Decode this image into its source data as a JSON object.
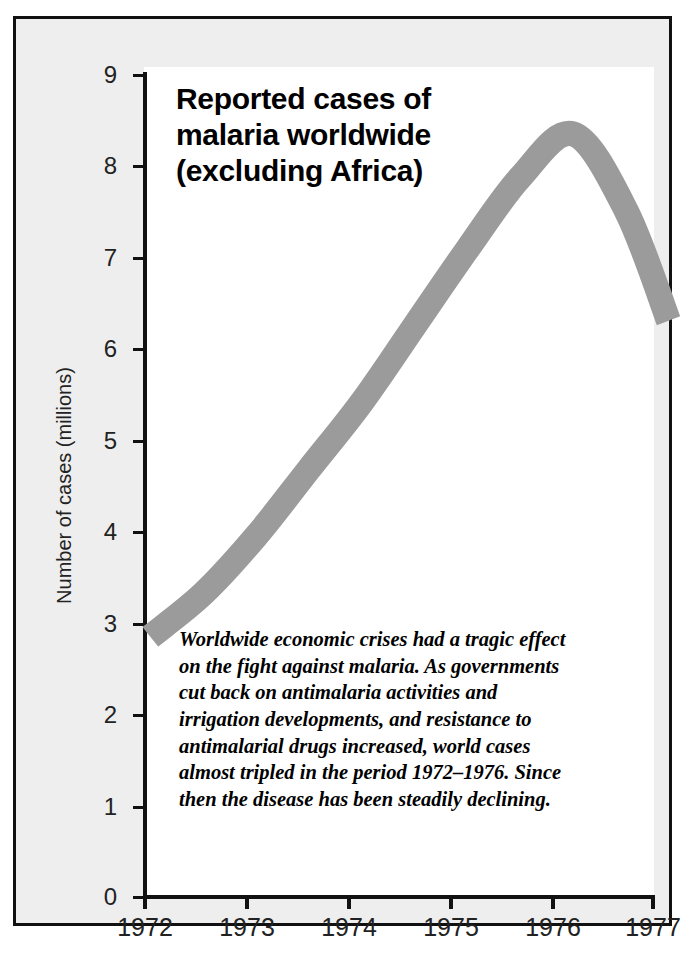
{
  "figure": {
    "background_color": "#ffffff",
    "panel_fill": "#eeeeee",
    "plot_fill": "#ffffff",
    "frame_color": "#111111"
  },
  "chart_data": {
    "type": "line",
    "title": "Reported cases of malaria worldwide (excluding Africa)",
    "title_lines": [
      "Reported cases of",
      "malaria worldwide",
      "(excluding Africa)"
    ],
    "xlabel": "",
    "ylabel": "Number of cases (millions)",
    "xlim": [
      1972,
      1977
    ],
    "ylim": [
      0,
      9
    ],
    "xticks": [
      1972,
      1973,
      1974,
      1975,
      1976,
      1977
    ],
    "xtick_labels": [
      "1972",
      "1973",
      "1974",
      "1975",
      "1976",
      "1977"
    ],
    "yticks": [
      0,
      1,
      2,
      3,
      4,
      5,
      6,
      7,
      8,
      9
    ],
    "ytick_labels": [
      "0",
      "1",
      "2",
      "3",
      "4",
      "5",
      "6",
      "7",
      "8",
      "9"
    ],
    "grid": false,
    "legend": false,
    "series_style": {
      "name": "Reported malaria cases (excluding Africa)",
      "render": "thick-band",
      "color": "#9b9b9b",
      "band_width_units": 0.26,
      "line_width_px": 24
    },
    "x": [
      1972,
      1972.5,
      1973,
      1973.5,
      1974,
      1974.5,
      1975,
      1975.5,
      1976,
      1976.5,
      1976.9
    ],
    "values": [
      3.15,
      3.6,
      4.2,
      4.9,
      5.6,
      6.4,
      7.2,
      7.95,
      8.4,
      7.6,
      6.45
    ],
    "annotations": [
      {
        "name": "caption",
        "text": "Worldwide economic crises had a tragic effect on the fight against malaria. As governments cut back on antimalaria activities and irrigation developments, and resistance to antimalarial drugs increased, world cases almost tripled in the period 1972–1976. Since then the disease has been steadily declining.",
        "lines": [
          "Worldwide economic crises had a tragic effect",
          "on the fight against malaria. As governments",
          "cut back on antimalaria activities and",
          "irrigation developments, and resistance to",
          "antimalarial drugs increased, world cases",
          "almost tripled in the period 1972–1976. Since",
          "then the disease has been steadily declining."
        ]
      }
    ]
  }
}
